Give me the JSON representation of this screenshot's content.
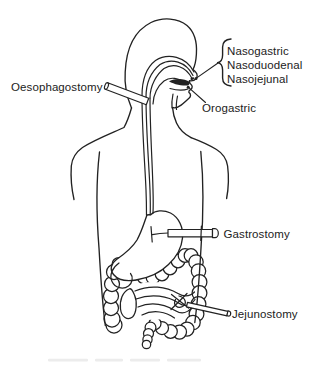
{
  "figure_labels": {
    "nasal_routes": [
      "Nasogastric",
      "Nasoduodenal",
      "Nasojejunal"
    ],
    "oesophagostomy": "Oesophagostomy",
    "orogastric": "Orogastric",
    "gastrostomy": "Gastrostomy",
    "jejunostomy": "Jejunostomy"
  },
  "colors": {
    "ink": "#222222",
    "background": "#ffffff"
  }
}
